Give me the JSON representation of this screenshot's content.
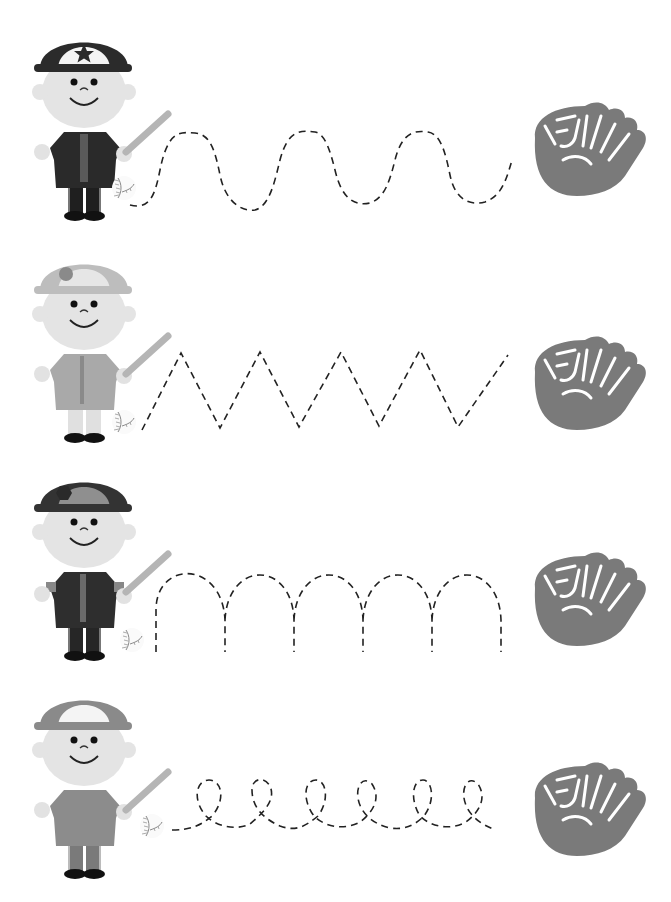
{
  "worksheet": {
    "title": "Baseball tracing worksheet",
    "instruction": "Trace the dashed line from the ball to the glove",
    "colors": {
      "background": "#ffffff",
      "dash_line": "#222222",
      "glove": "#7a7a7a",
      "skin": "#e2e2e2",
      "bat": "#b5b5b5",
      "shoe": "#111111"
    },
    "rows": [
      {
        "id": 1,
        "player": {
          "cap_color": "#2b2b2b",
          "cap_front": "#f4f4f4",
          "cap_logo": "star",
          "shirt": "#2a2a2a",
          "pants": "#1f1f1f"
        },
        "path_type": "wave",
        "start_icon": "baseball-icon",
        "end_icon": "glove-icon"
      },
      {
        "id": 2,
        "player": {
          "cap_color": "#bdbdbd",
          "cap_front": "#e6e6e6",
          "cap_logo": "circle",
          "shirt": "#a9a9a9",
          "pants": "#e0e0e0"
        },
        "path_type": "zigzag",
        "start_icon": "baseball-icon",
        "end_icon": "glove-icon"
      },
      {
        "id": 3,
        "player": {
          "cap_color": "#333333",
          "cap_front": "#8f8f8f",
          "cap_logo": "hexagon",
          "shirt": "#2e2e2e",
          "pants": "#262626"
        },
        "path_type": "arches",
        "start_icon": "baseball-icon",
        "end_icon": "glove-icon"
      },
      {
        "id": 4,
        "player": {
          "cap_color": "#8a8a8a",
          "cap_front": "#f4f4f4",
          "cap_logo": "none",
          "shirt": "#8c8c8c",
          "pants": "#7a7a7a"
        },
        "path_type": "loops",
        "start_icon": "baseball-icon",
        "end_icon": "glove-icon"
      }
    ]
  }
}
